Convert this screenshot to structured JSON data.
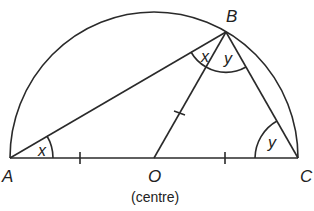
{
  "diagram": {
    "type": "geometry",
    "points": {
      "A": {
        "label": "A",
        "x": 10,
        "y": 158
      },
      "O": {
        "label": "O",
        "x": 154,
        "y": 158
      },
      "C": {
        "label": "C",
        "x": 298,
        "y": 158
      },
      "B": {
        "label": "B",
        "x": 226,
        "y": 32
      }
    },
    "centre_caption": "(centre)",
    "angle_labels": {
      "angle_A": "x",
      "angle_ABO": "x",
      "angle_OBC": "y",
      "angle_C": "y"
    },
    "equal_segment_marks": [
      "AO",
      "OC",
      "OB"
    ],
    "colors": {
      "stroke": "#2a2a2a",
      "background": "#ffffff"
    }
  }
}
